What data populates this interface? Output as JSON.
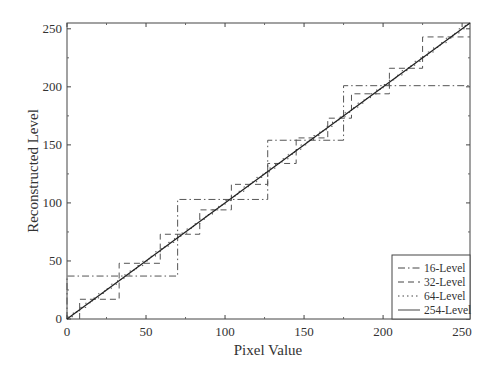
{
  "chart_data": {
    "type": "line",
    "title": "",
    "xlabel": "Pixel Value",
    "ylabel": "Reconstructed Level",
    "xlim": [
      0,
      255
    ],
    "ylim": [
      0,
      255
    ],
    "xticks": [
      0,
      50,
      100,
      150,
      200,
      250
    ],
    "yticks": [
      0,
      50,
      100,
      150,
      200,
      250
    ],
    "grid": false,
    "legend_position": "lower right",
    "series": [
      {
        "name": "16-Level",
        "style": "dash-dot",
        "step": true,
        "breaks": [
          0,
          70,
          127,
          175,
          255
        ],
        "levels": [
          37,
          103,
          154,
          201
        ]
      },
      {
        "name": "32-Level",
        "style": "dashed",
        "step": true,
        "breaks": [
          8,
          33,
          59,
          84,
          104,
          127,
          145,
          165,
          180,
          204,
          225,
          255
        ],
        "levels": [
          17,
          48,
          73,
          94,
          116,
          134,
          156,
          173,
          194,
          216,
          243
        ]
      },
      {
        "name": "64-Level",
        "style": "dotted",
        "step": true,
        "description": "fine staircase closely following the diagonal"
      },
      {
        "name": "254-Level",
        "style": "solid",
        "x": [
          0,
          255
        ],
        "y": [
          0,
          255
        ]
      }
    ]
  },
  "axes": {
    "xlabel": "Pixel Value",
    "ylabel": "Reconstructed Level",
    "xtick_labels": [
      "0",
      "50",
      "100",
      "150",
      "200",
      "250"
    ],
    "ytick_labels": [
      "0",
      "50",
      "100",
      "150",
      "200",
      "250"
    ]
  },
  "legend": {
    "items": [
      "16-Level",
      "32-Level",
      "64-Level",
      "254-Level"
    ]
  }
}
